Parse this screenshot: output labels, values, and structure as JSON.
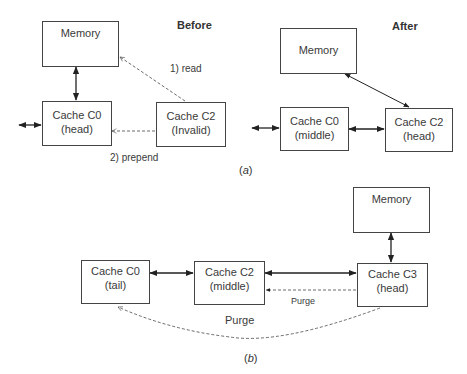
{
  "panel_a": {
    "caption_open": "(",
    "caption_letter": "a",
    "caption_close": ")",
    "before": {
      "title": "Before",
      "memory": "Memory",
      "c0_name": "Cache C0",
      "c0_state": "(head)",
      "c2_name": "Cache C2",
      "c2_state": "(Invalid)",
      "read_label": "1) read",
      "prepend_label": "2) prepend"
    },
    "after": {
      "title": "After",
      "memory": "Memory",
      "c0_name": "Cache C0",
      "c0_state": "(middle)",
      "c2_name": "Cache C2",
      "c2_state": "(head)"
    }
  },
  "panel_b": {
    "caption_open": "(",
    "caption_letter": "b",
    "caption_close": ")",
    "memory": "Memory",
    "c0_name": "Cache C0",
    "c0_state": "(tail)",
    "c2_name": "Cache C2",
    "c2_state": "(middle)",
    "c3_name": "Cache C3",
    "c3_state": "(head)",
    "purge_short": "Purge",
    "purge_long": "Purge"
  }
}
